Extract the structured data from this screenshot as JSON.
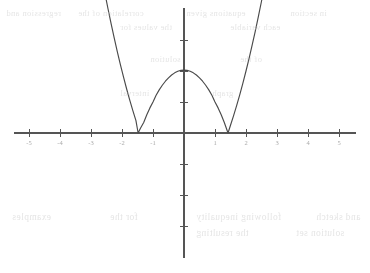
{
  "figure": {
    "background_color": "#ffffff",
    "axis_color": "#555555",
    "curve_color": "#4a4a4a",
    "ghost_text_color": "#cfcfcf"
  },
  "axes": {
    "origin_px": {
      "x": 184,
      "y": 133
    },
    "unit_px": 31,
    "x_axis": {
      "start_px": 14,
      "end_px": 356,
      "label": "",
      "ticks_left": 5,
      "ticks_right": 5
    },
    "y_axis": {
      "start_px": 8,
      "end_px": 258,
      "label": "",
      "ticks_up": 3,
      "ticks_down": 3
    },
    "x_tick_values": [
      -5,
      -4,
      -3,
      -2,
      -1,
      1,
      2,
      3,
      4,
      5
    ],
    "y_tick_values": [
      1,
      2,
      3,
      -1,
      -2,
      -3
    ],
    "x_tick_labels": [
      "-5",
      "-4",
      "-3",
      "-2",
      "-1",
      "1",
      "2",
      "3",
      "4",
      "5"
    ],
    "y_tick_labels": [
      "",
      "",
      "",
      "",
      "",
      ""
    ],
    "grid": false
  },
  "chart_data": {
    "type": "line",
    "title": "",
    "subtitle": "",
    "xlabel": "x",
    "ylabel": "y",
    "xlim": [
      -5.5,
      5.5
    ],
    "ylim": [
      -4.0,
      4.0
    ],
    "grid": false,
    "legend": null,
    "annotations": [],
    "series": [
      {
        "name": "y = |x^2 - 2|",
        "equation": "y = |x^2 - 2|",
        "color": "#4a4a4a",
        "roots": [
          -1.48,
          1.42
        ],
        "local_max": {
          "x": 0,
          "y": 2.03
        },
        "x": [
          -2.85,
          -2.75,
          -2.65,
          -2.55,
          -2.45,
          -2.35,
          -2.25,
          -2.15,
          -2.05,
          -1.95,
          -1.85,
          -1.75,
          -1.65,
          -1.55,
          -1.48,
          -1.4,
          -1.3,
          -1.2,
          -1.1,
          -1.0,
          -0.9,
          -0.8,
          -0.7,
          -0.6,
          -0.5,
          -0.4,
          -0.3,
          -0.2,
          -0.1,
          0.0,
          0.1,
          0.2,
          0.3,
          0.4,
          0.5,
          0.6,
          0.7,
          0.8,
          0.9,
          1.0,
          1.1,
          1.2,
          1.3,
          1.42,
          1.5,
          1.6,
          1.7,
          1.8,
          1.9,
          2.0,
          2.1,
          2.2,
          2.3,
          2.4,
          2.5,
          2.6,
          2.7,
          2.8
        ],
        "y": [
          6.1,
          5.54,
          5.0,
          4.5,
          4.0,
          3.52,
          3.06,
          2.62,
          2.2,
          1.8,
          1.42,
          1.06,
          0.72,
          0.4,
          0.0,
          0.16,
          0.34,
          0.59,
          0.81,
          1.0,
          1.22,
          1.39,
          1.54,
          1.67,
          1.78,
          1.87,
          1.94,
          1.99,
          2.02,
          2.03,
          2.02,
          1.99,
          1.94,
          1.87,
          1.78,
          1.67,
          1.54,
          1.39,
          1.22,
          1.0,
          0.81,
          0.59,
          0.34,
          0.0,
          0.25,
          0.56,
          0.89,
          1.24,
          1.61,
          2.0,
          2.41,
          2.84,
          3.29,
          3.76,
          4.25,
          4.76,
          5.29,
          5.84
        ]
      }
    ]
  },
  "ghost_text": {
    "note": "faint scanner bleed-through from reverse side of page; illegible",
    "lines": [
      {
        "text": "regression and",
        "x": 6,
        "y": 8,
        "size": 8.5
      },
      {
        "text": "correlation of the",
        "x": 78,
        "y": 8,
        "size": 8.5
      },
      {
        "text": "equations given",
        "x": 186,
        "y": 8,
        "size": 8.5
      },
      {
        "text": "in section",
        "x": 290,
        "y": 8,
        "size": 8.5
      },
      {
        "text": "the values for",
        "x": 120,
        "y": 22,
        "size": 8.5
      },
      {
        "text": "each variable",
        "x": 230,
        "y": 22,
        "size": 8.5
      },
      {
        "text": "solution",
        "x": 150,
        "y": 54,
        "size": 8.5
      },
      {
        "text": "of the",
        "x": 240,
        "y": 54,
        "size": 8.5
      },
      {
        "text": "interval",
        "x": 120,
        "y": 88,
        "size": 8.5
      },
      {
        "text": "graph",
        "x": 212,
        "y": 88,
        "size": 8.5
      },
      {
        "text": "examples",
        "x": 12,
        "y": 212,
        "size": 9.5
      },
      {
        "text": "for the",
        "x": 110,
        "y": 212,
        "size": 9.5
      },
      {
        "text": "following inequality",
        "x": 196,
        "y": 212,
        "size": 9.5
      },
      {
        "text": "and sketch",
        "x": 316,
        "y": 212,
        "size": 9.5
      },
      {
        "text": "the resulting",
        "x": 196,
        "y": 228,
        "size": 9.5
      },
      {
        "text": "solution set",
        "x": 296,
        "y": 228,
        "size": 9.5
      }
    ]
  }
}
